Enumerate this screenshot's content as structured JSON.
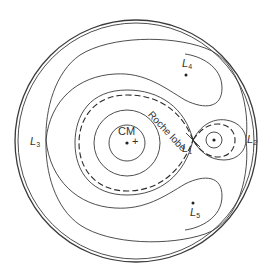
{
  "diagram": {
    "labels": {
      "cm": "CM",
      "roche_lobe": "Roche lobe",
      "l1": {
        "letter": "L",
        "sub": "1"
      },
      "l2": {
        "letter": "L",
        "sub": "2"
      },
      "l3": {
        "letter": "L",
        "sub": "3"
      },
      "l4": {
        "letter": "L",
        "sub": "4"
      },
      "l5": {
        "letter": "L",
        "sub": "5"
      }
    },
    "markers": {
      "cm_symbol": "+"
    },
    "colors": {
      "stroke": "#3a3a3a",
      "background": "#ffffff"
    }
  }
}
